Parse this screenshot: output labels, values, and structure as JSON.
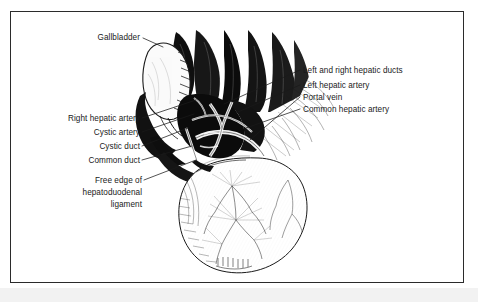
{
  "figure": {
    "kind": "anatomical-line-illustration",
    "style": "black-and-white engraved medical drawing with leader-line callouts",
    "border_color": "#2b2b2b",
    "ink_color": "#1a1a1a",
    "paper_color": "#ffffff"
  },
  "labels": {
    "gallbladder": "Gallbladder",
    "right_hepatic_artery": "Right hepatic artery",
    "cystic_artery": "Cystic artery",
    "cystic_duct": "Cystic duct",
    "common_duct": "Common duct",
    "free_edge_line1": "Free edge of",
    "free_edge_line2": "hepatoduodenal",
    "free_edge_line3": "ligament",
    "left_and_right_hepatic_ducts": "Left and right hepatic ducts",
    "left_hepatic_artery": "Left hepatic artery",
    "portal_vein": "Portal vein",
    "common_hepatic_artery": "Common hepatic artery"
  },
  "callouts": {
    "left_side": [
      "Right hepatic artery",
      "Cystic artery",
      "Cystic duct",
      "Common duct",
      "Free edge of hepatoduodenal ligament"
    ],
    "right_side": [
      "Left and right hepatic ducts",
      "Left hepatic artery",
      "Portal vein",
      "Common hepatic artery"
    ],
    "top_left": [
      "Gallbladder"
    ]
  },
  "structures": [
    "liver lobes",
    "gallbladder",
    "porta hepatis vessels",
    "duodenum",
    "hepatoduodenal ligament"
  ]
}
